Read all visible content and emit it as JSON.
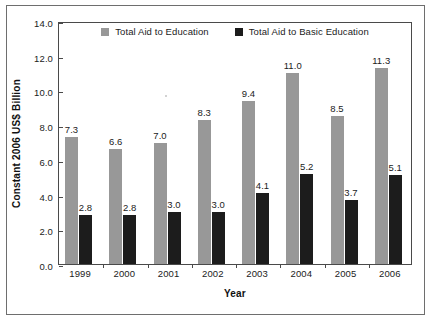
{
  "chart_data": {
    "type": "bar",
    "title": "",
    "xlabel": "Year",
    "ylabel": "Constant 2006 US$ Billion",
    "categories": [
      "1999",
      "2000",
      "2001",
      "2002",
      "2003",
      "2004",
      "2005",
      "2006"
    ],
    "series": [
      {
        "name": "Total Aid to Education",
        "color": "#989898",
        "values": [
          7.3,
          6.6,
          7.0,
          8.3,
          9.4,
          11.0,
          8.5,
          11.3
        ],
        "labels": [
          "7.3",
          "6.6",
          "7.0",
          "8.3",
          "9.4",
          "11.0",
          "8.5",
          "11.3"
        ]
      },
      {
        "name": "Total Aid to Basic Education",
        "color": "#1c1c1c",
        "values": [
          2.8,
          2.8,
          3.0,
          3.0,
          4.1,
          5.2,
          3.7,
          5.1
        ],
        "labels": [
          "2.8",
          "2.8",
          "3.0",
          "3.0",
          "4.1",
          "5.2",
          "3.7",
          "5.1"
        ]
      }
    ],
    "ylim": [
      0.0,
      14.0
    ],
    "ytick_labels": [
      "14.0",
      "12.0",
      "10.0",
      "8.0",
      "6.0",
      "4.0",
      "2.0",
      "0.0"
    ],
    "ytick_values": [
      14.0,
      12.0,
      10.0,
      8.0,
      6.0,
      4.0,
      2.0,
      0.0
    ],
    "grid": false,
    "legend_position": "top-center"
  }
}
